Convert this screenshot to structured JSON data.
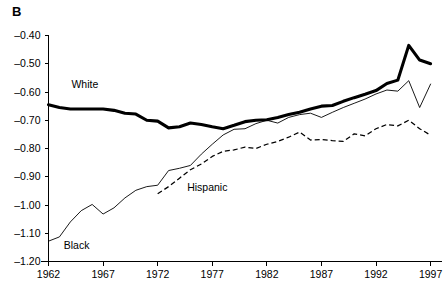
{
  "panel": {
    "label": "B"
  },
  "chart_data": {
    "type": "line",
    "title": "",
    "subtitle": "",
    "xlabel": "",
    "ylabel": "",
    "xlim": [
      1962,
      1998
    ],
    "ylim": [
      -1.2,
      -0.4
    ],
    "grid": false,
    "legend_position": "inline-annotations",
    "xticks": [
      "1962",
      "1967",
      "1972",
      "1977",
      "1982",
      "1987",
      "1992",
      "1997"
    ],
    "xtick_values": [
      1962,
      1967,
      1972,
      1977,
      1982,
      1987,
      1992,
      1997
    ],
    "yticks": [
      "-0.40",
      "-0.50",
      "-0.60",
      "-0.70",
      "-0.80",
      "-0.90",
      "-1.00",
      "-1.10",
      "-1.20"
    ],
    "ytick_values": [
      -0.4,
      -0.5,
      -0.6,
      -0.7,
      -0.8,
      -0.9,
      -1.0,
      -1.1,
      -1.2
    ],
    "x": [
      1962,
      1963,
      1964,
      1965,
      1966,
      1967,
      1968,
      1969,
      1970,
      1971,
      1972,
      1973,
      1974,
      1975,
      1976,
      1977,
      1978,
      1979,
      1980,
      1981,
      1982,
      1983,
      1984,
      1985,
      1986,
      1987,
      1988,
      1989,
      1990,
      1991,
      1992,
      1993,
      1994,
      1995,
      1996,
      1997
    ],
    "series": [
      {
        "name": "White",
        "style": "thick-solid",
        "color": "#000000",
        "label_x": 1964.1,
        "label_y": -0.585,
        "values": [
          -0.645,
          -0.655,
          -0.66,
          -0.66,
          -0.66,
          -0.66,
          -0.665,
          -0.675,
          -0.678,
          -0.7,
          -0.703,
          -0.727,
          -0.723,
          -0.71,
          -0.715,
          -0.723,
          -0.73,
          -0.718,
          -0.705,
          -0.7,
          -0.698,
          -0.69,
          -0.68,
          -0.672,
          -0.66,
          -0.65,
          -0.648,
          -0.633,
          -0.62,
          -0.608,
          -0.595,
          -0.57,
          -0.558,
          -0.435,
          -0.487,
          -0.5
        ]
      },
      {
        "name": "Black",
        "style": "thin-solid",
        "color": "#000000",
        "label_x": 1963.4,
        "label_y": -1.155,
        "values": [
          -1.128,
          -1.113,
          -1.06,
          -1.02,
          -0.998,
          -1.032,
          -1.01,
          -0.975,
          -0.948,
          -0.935,
          -0.93,
          -0.878,
          -0.87,
          -0.86,
          -0.82,
          -0.785,
          -0.752,
          -0.732,
          -0.73,
          -0.712,
          -0.7,
          -0.71,
          -0.69,
          -0.68,
          -0.675,
          -0.69,
          -0.672,
          -0.655,
          -0.64,
          -0.625,
          -0.607,
          -0.593,
          -0.597,
          -0.56,
          -0.655,
          -0.572
        ]
      },
      {
        "name": "Hispanic",
        "style": "dashed",
        "color": "#000000",
        "label_x": 1974.7,
        "label_y": -0.95,
        "values": [
          null,
          null,
          null,
          null,
          null,
          null,
          null,
          null,
          null,
          null,
          -0.96,
          -0.935,
          -0.905,
          -0.875,
          -0.855,
          -0.828,
          -0.81,
          -0.805,
          -0.795,
          -0.8,
          -0.785,
          -0.775,
          -0.76,
          -0.742,
          -0.77,
          -0.768,
          -0.772,
          -0.775,
          -0.748,
          -0.755,
          -0.73,
          -0.715,
          -0.72,
          -0.7,
          -0.73,
          -0.753
        ]
      }
    ]
  }
}
